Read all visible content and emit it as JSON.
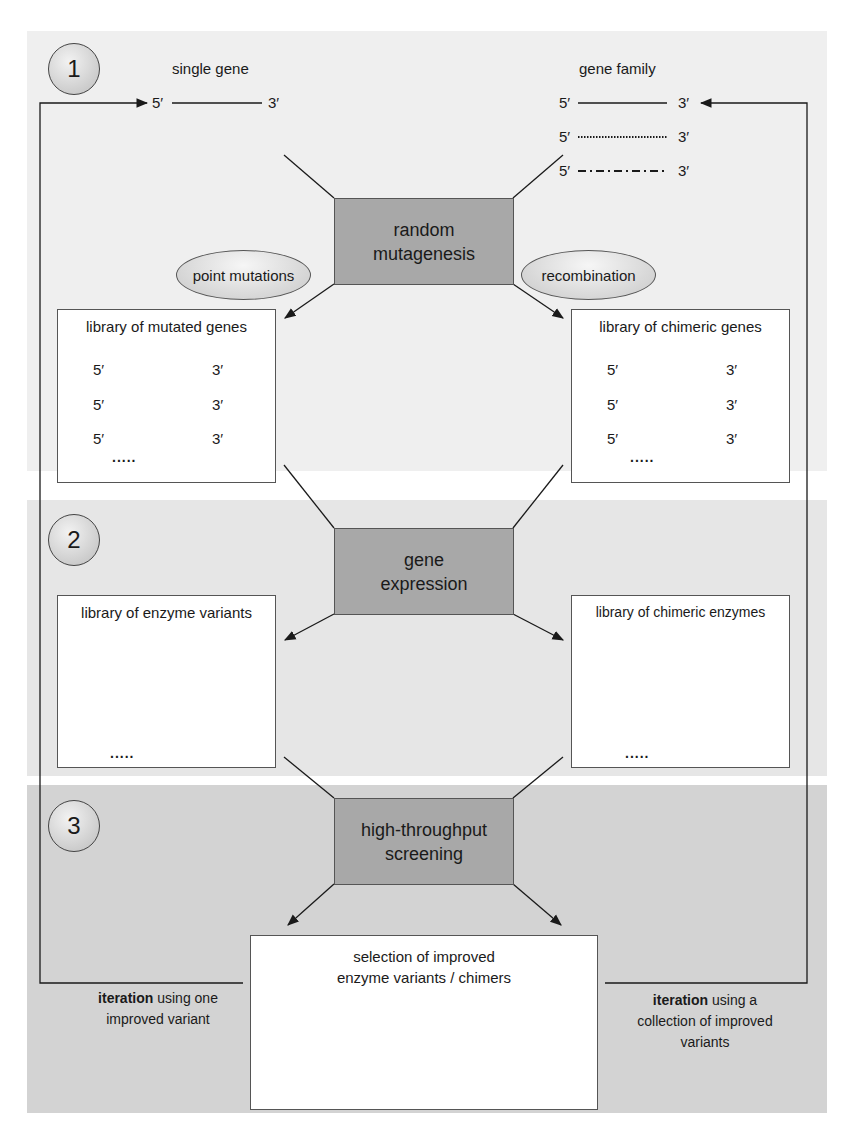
{
  "steps": [
    {
      "number": "1",
      "process": [
        "random",
        "mutagenesis"
      ]
    },
    {
      "number": "2",
      "process": [
        "gene",
        "expression"
      ]
    },
    {
      "number": "3",
      "process": [
        "high-throughput",
        "screening"
      ]
    }
  ],
  "inputs": {
    "single_gene": {
      "title": "single gene",
      "five": "5′",
      "three": "3′"
    },
    "gene_family": {
      "title": "gene family",
      "five": "5′",
      "three": "3′",
      "line_styles": [
        "solid",
        "dotted",
        "dash-dot"
      ]
    }
  },
  "methods": {
    "left": "point mutations",
    "right": "recombination"
  },
  "libraries": {
    "mutated_genes": {
      "title": "library of mutated genes",
      "five": "5′",
      "three": "3′",
      "more": "....."
    },
    "chimeric_genes": {
      "title": "library of chimeric genes",
      "five": "5′",
      "three": "3′",
      "more": "....."
    },
    "enzyme_variants": {
      "title": "library of enzyme variants",
      "more": "....."
    },
    "chimeric_enzymes": {
      "title": "library of chimeric enzymes",
      "more": "....."
    }
  },
  "selection": {
    "title_line1": "selection of improved",
    "title_line2": "enzyme variants / chimers"
  },
  "iterations": {
    "left": {
      "bold": "iteration",
      "rest1": " using one",
      "line2": "improved variant"
    },
    "right": {
      "bold": "iteration",
      "rest1": " using a",
      "line2": "collection of improved",
      "line3": "variants"
    }
  },
  "colors": {
    "band1": "#efefef",
    "band2": "#e6e6e6",
    "band3": "#d3d3d3",
    "process_box": "#a8a8a8",
    "line": "#1a1a1a"
  }
}
